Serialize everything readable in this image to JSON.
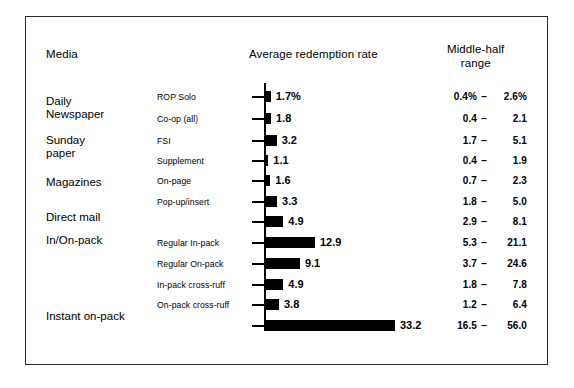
{
  "header": {
    "col_media": "Media",
    "col_average": "Average redemption rate",
    "col_range_line1": "Middle-half",
    "col_range_line2": "range"
  },
  "chart_data": {
    "type": "bar",
    "title": "Average redemption rate",
    "xlabel": "Average redemption rate (%)",
    "ylabel": "Media",
    "orientation": "horizontal",
    "grid": false,
    "legend": null,
    "xlim": [
      0,
      35
    ],
    "categories": [
      "ROP Solo",
      "Co-op (all)",
      "FSI",
      "Supplement",
      "On-page",
      "Pop-up/insert",
      "Direct mail",
      "Regular In-pack",
      "Regular On-pack",
      "In-pack cross-ruff",
      "On-pack cross-ruff",
      "Instant on-pack"
    ],
    "values": [
      1.7,
      1.8,
      3.2,
      1.1,
      1.6,
      3.3,
      4.9,
      12.9,
      9.1,
      4.9,
      3.8,
      33.2
    ],
    "value_labels": [
      "1.7%",
      "1.8",
      "3.2",
      "1.1",
      "1.6",
      "3.3",
      "4.9",
      "12.9",
      "9.1",
      "4.9",
      "3.8",
      "33.2"
    ],
    "middle_half_range_low": [
      0.4,
      0.4,
      1.7,
      0.4,
      0.7,
      1.8,
      2.9,
      5.3,
      3.7,
      1.8,
      1.2,
      16.5
    ],
    "middle_half_range_high": [
      2.6,
      2.1,
      5.1,
      1.9,
      2.3,
      5.0,
      8.1,
      21.1,
      24.6,
      7.8,
      6.4,
      56.0
    ],
    "range_labels": [
      {
        "low": "0.4%",
        "dash": "–",
        "high": "2.6%"
      },
      {
        "low": "0.4",
        "dash": "–",
        "high": "2.1"
      },
      {
        "low": "1.7",
        "dash": "–",
        "high": "5.1"
      },
      {
        "low": "0.4",
        "dash": "–",
        "high": "1.9"
      },
      {
        "low": "0.7",
        "dash": "–",
        "high": "2.3"
      },
      {
        "low": "1.8",
        "dash": "–",
        "high": "5.0"
      },
      {
        "low": "2.9",
        "dash": "–",
        "high": "8.1"
      },
      {
        "low": "5.3",
        "dash": "–",
        "high": "21.1"
      },
      {
        "low": "3.7",
        "dash": "–",
        "high": "24.6"
      },
      {
        "low": "1.8",
        "dash": "–",
        "high": "7.8"
      },
      {
        "low": "1.2",
        "dash": "–",
        "high": "6.4"
      },
      {
        "low": "16.5",
        "dash": "–",
        "high": "56.0"
      }
    ],
    "media_groups": [
      {
        "line1": "Daily",
        "line2": "Newspaper"
      },
      {
        "line1": "Sunday",
        "line2": "paper"
      },
      {
        "line1": "Magazines",
        "line2": ""
      },
      {
        "line1": "Direct mail",
        "line2": ""
      },
      {
        "line1": "In/On-pack",
        "line2": ""
      },
      {
        "line1": "Instant on-pack",
        "line2": ""
      }
    ]
  },
  "style": {
    "bar_color": "#000000",
    "axis_color": "#000000",
    "frame_color": "#2b2b2b",
    "background": "#ffffff"
  }
}
